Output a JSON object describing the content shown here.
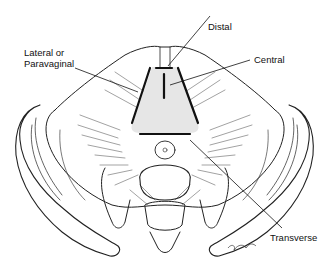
{
  "figure": {
    "labels": {
      "distal": "Distal",
      "lateral_line1": "Lateral or",
      "lateral_line2": "Paravaginal",
      "central": "Central",
      "transverse": "Transverse"
    },
    "signature": "artist signature"
  }
}
